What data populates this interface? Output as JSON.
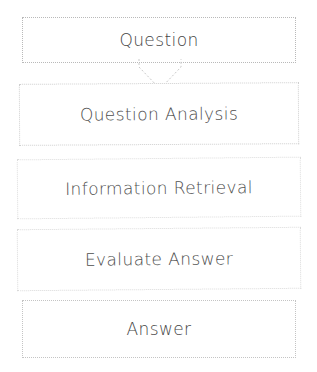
{
  "diagram": {
    "type": "vertical-flowchart",
    "background_color": "#ffffff",
    "text_color": "#4a4a4a",
    "border_color": "#c8c8c8",
    "nodes": [
      {
        "id": "question",
        "label": "Question",
        "order": 1
      },
      {
        "id": "question-analysis",
        "label": "Question Analysis",
        "order": 2
      },
      {
        "id": "information-retrieval",
        "label": "Information Retrieval",
        "order": 3
      },
      {
        "id": "evaluate-answer",
        "label": "Evaluate Answer",
        "order": 4
      },
      {
        "id": "answer",
        "label": "Answer",
        "order": 5
      }
    ],
    "connectors": [
      {
        "id": "question-to-analysis",
        "from": "question",
        "to": "question-analysis",
        "icon": "down-arrow-icon",
        "direction": "down"
      }
    ]
  }
}
